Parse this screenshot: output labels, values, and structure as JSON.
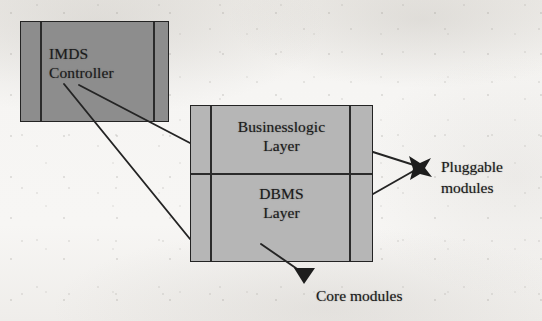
{
  "diagram": {
    "background_color": "#f4f3f1",
    "stroke_color": "#232323",
    "nodes": {
      "imds_controller": {
        "label_line1": "IMDS",
        "label_line2": "Controller",
        "fill_color": "#8d8d8d"
      },
      "layer_stack": {
        "fill_color": "#b6b6b6",
        "cells": [
          {
            "label_line1": "Businesslogic",
            "label_line2": "Layer"
          },
          {
            "label_line1": "DBMS",
            "label_line2": "Layer"
          }
        ]
      }
    },
    "annotations": {
      "pluggable_modules_line1": "Pluggable",
      "pluggable_modules_line2": "modules",
      "core_modules": "Core modules"
    }
  }
}
